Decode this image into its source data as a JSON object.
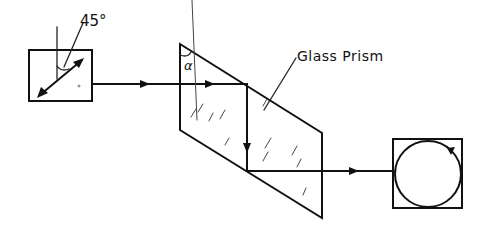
{
  "diagram": {
    "title": "",
    "labels": {
      "angle_45": "45°",
      "angle_alpha": "α",
      "prism": "Glass Prism"
    },
    "components": [
      {
        "id": "linear-polarizer",
        "description": "Square box with double-headed arrow at 45° to vertical (linear polarization)"
      },
      {
        "id": "glass-prism",
        "description": "Parallelogram glass prism (Fresnel rhomb) with apex angle α"
      },
      {
        "id": "circular-output",
        "description": "Square box with circle and arrow (circular polarization)"
      }
    ],
    "beam_path": [
      "linear-polarizer",
      "glass-prism (total internal reflection, down)",
      "glass-prism (second reflection, right)",
      "circular-output"
    ],
    "colors": {
      "ink": "#111111",
      "background": "#ffffff"
    }
  }
}
